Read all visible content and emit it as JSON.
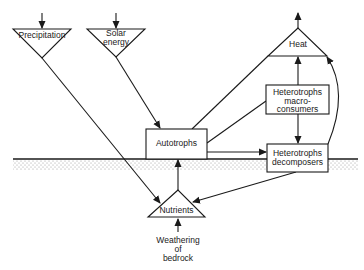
{
  "diagram": {
    "type": "ecosystem energy and nutrient flow",
    "inputs": {
      "precipitation": "Precipitation",
      "solar_line1": "Solar",
      "solar_line2": "energy"
    },
    "output": {
      "heat": "Heat"
    },
    "nodes": {
      "autotrophs": "Autotrophs",
      "macro_line1": "Heterotrophs",
      "macro_line2": "macro-",
      "macro_line3": "consumers",
      "decomp_line1": "Heterotrophs",
      "decomp_line2": "decomposers",
      "nutrients": "Nutrients"
    },
    "source": {
      "line1": "Weathering",
      "line2": "of",
      "line3": "bedrock"
    },
    "edges": [
      {
        "from": "Precipitation",
        "to": "Nutrients"
      },
      {
        "from": "Solar energy",
        "to": "Autotrophs"
      },
      {
        "from": "Autotrophs",
        "to": "Heat"
      },
      {
        "from": "Autotrophs",
        "to": "Heterotrophs macro-consumers"
      },
      {
        "from": "Autotrophs",
        "to": "Heterotrophs decomposers"
      },
      {
        "from": "Heterotrophs macro-consumers",
        "to": "Heat"
      },
      {
        "from": "Heterotrophs macro-consumers",
        "to": "Heterotrophs decomposers"
      },
      {
        "from": "Heterotrophs decomposers",
        "to": "Heat"
      },
      {
        "from": "Heterotrophs decomposers",
        "to": "Nutrients"
      },
      {
        "from": "Nutrients",
        "to": "Autotrophs"
      },
      {
        "from": "Weathering of bedrock",
        "to": "Nutrients"
      }
    ]
  }
}
